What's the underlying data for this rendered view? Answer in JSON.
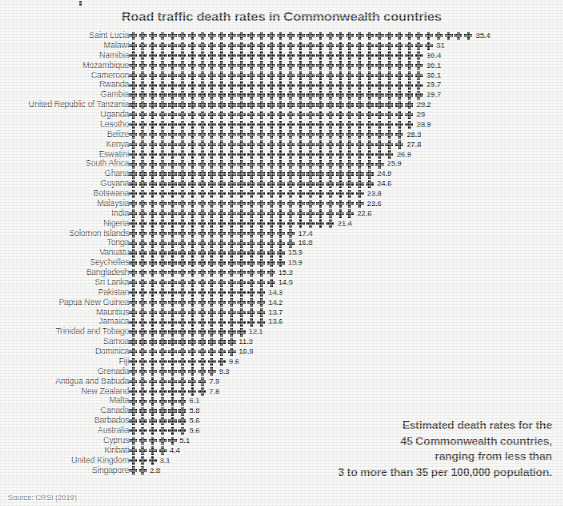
{
  "header": {
    "title": "Road traffic death rates in Commonwealth countries"
  },
  "callout": {
    "line1": "Estimated death rates for the",
    "line2": "45 Commonwealth countries,",
    "line3": "ranging from less than",
    "line4": "3 to more than 35 per 100,000 population."
  },
  "footer": {
    "source": "Source: CRSI (2019)"
  },
  "icon": {
    "glyph_name": "cross-pictogram-icon",
    "color": "#111111",
    "unit": 1
  },
  "colors": {
    "background": "#f1f1f0",
    "ink": "#111111",
    "source_text": "#5a5a5a"
  },
  "chart_data": {
    "type": "bar",
    "subtype": "pictogram-isotype-bar",
    "title": "Road traffic death rates in Commonwealth countries",
    "xlabel": "",
    "ylabel": "",
    "unit_label": "per 100,000 population",
    "unit_per_icon": 1,
    "grid": false,
    "legend": false,
    "xlim": [
      0,
      35.4
    ],
    "orientation": "horizontal",
    "sort": "descending",
    "source": "CRSI (2019)",
    "categories": [
      "Saint Lucia",
      "Malawi",
      "Namibia",
      "Mozambique",
      "Cameroon",
      "Rwanda",
      "Gambia",
      "United Republic of Tanzania",
      "Uganda",
      "Lesotho",
      "Belize",
      "Kenya",
      "Eswatini",
      "South Africa",
      "Ghana",
      "Guyana",
      "Botswana",
      "Malaysia",
      "India",
      "Nigeria",
      "Solomon Islands",
      "Tonga",
      "Vanuatu",
      "Seychelles",
      "Bangladesh",
      "Sri Lanka",
      "Pakistan",
      "Papua New Guinea",
      "Mauritius",
      "Jamaica",
      "Trinidad and Tobago",
      "Samoa",
      "Dominica",
      "Fiji",
      "Grenada",
      "Antigua and Babuda",
      "New Zealand",
      "Malta",
      "Canada",
      "Barbados",
      "Australia",
      "Cyprus",
      "Kiribati",
      "United Kingdom",
      "Singapore"
    ],
    "values": [
      35.4,
      31,
      30.4,
      30.1,
      30.1,
      29.7,
      29.7,
      29.2,
      29,
      28.9,
      28.3,
      27.8,
      26.9,
      25.9,
      24.9,
      24.6,
      23.8,
      23.6,
      22.6,
      21.4,
      17.4,
      16.8,
      15.9,
      15.9,
      15.3,
      14.9,
      14.3,
      14.2,
      13.7,
      13.6,
      12.1,
      11.3,
      10.9,
      9.6,
      9.3,
      7.9,
      7.8,
      6.1,
      5.8,
      5.6,
      5.6,
      5.1,
      4.4,
      3.1,
      2.8
    ],
    "value_labels": [
      "35.4",
      "31",
      "30.4",
      "30.1",
      "30.1",
      "29.7",
      "29.7",
      "29.2",
      "29",
      "28.9",
      "28.3",
      "27.8",
      "26.9",
      "25.9",
      "24.9",
      "24.6",
      "23.8",
      "23.6",
      "22.6",
      "21.4",
      "17.4",
      "16.8",
      "15.9",
      "15.9",
      "15.3",
      "14.9",
      "14.3",
      "14.2",
      "13.7",
      "13.6",
      "12.1",
      "11.3",
      "10.9",
      "9.6",
      "9.3",
      "7.9",
      "7.8",
      "6.1",
      "5.8",
      "5.6",
      "5.6",
      "5.1",
      "4.4",
      "3.1",
      "2.8"
    ],
    "icon_counts": [
      35,
      31,
      30,
      30,
      30,
      30,
      30,
      29,
      29,
      29,
      28,
      28,
      27,
      26,
      25,
      25,
      24,
      24,
      23,
      21,
      17,
      17,
      16,
      16,
      15,
      15,
      14,
      14,
      14,
      14,
      12,
      11,
      11,
      10,
      9,
      8,
      8,
      6,
      6,
      6,
      6,
      5,
      4,
      3,
      2
    ]
  }
}
